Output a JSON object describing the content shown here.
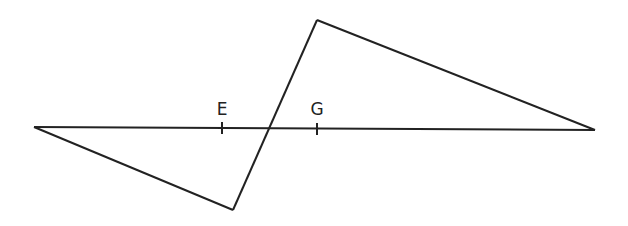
{
  "diagram": {
    "type": "geometry",
    "line_color": "#222222",
    "background": "#ffffff",
    "labels": [
      {
        "text": "E",
        "x": 222,
        "y": 115
      },
      {
        "text": "G",
        "x": 317,
        "y": 115
      }
    ],
    "points": {
      "left_vertex": [
        34,
        127
      ],
      "right_vertex": [
        595,
        130
      ],
      "top_vertex": [
        317,
        20
      ],
      "bottom_vertex": [
        233,
        210
      ],
      "crossing": [
        269,
        128
      ],
      "E_tick": [
        222,
        128
      ],
      "G_tick": [
        317,
        129
      ]
    }
  }
}
